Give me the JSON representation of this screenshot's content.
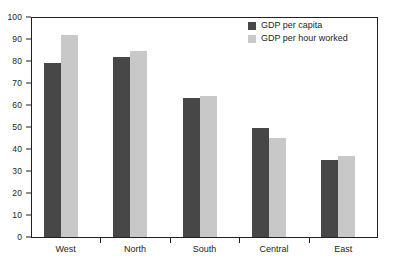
{
  "chart_data": {
    "type": "bar",
    "title": "",
    "subtitle": "",
    "xlabel": "",
    "ylabel": "",
    "categories": [
      "West",
      "North",
      "South",
      "Central",
      "East"
    ],
    "series": [
      {
        "name": "GDP per capita",
        "color": "#474747",
        "values": [
          79,
          82,
          63,
          49.5,
          35
        ]
      },
      {
        "name": "GDP per hour worked",
        "color": "#c8c8c8",
        "values": [
          92,
          84.5,
          64,
          45,
          37
        ]
      }
    ],
    "ylim": [
      0,
      100
    ],
    "ytick_values": [
      0,
      10,
      20,
      30,
      40,
      50,
      60,
      70,
      80,
      90,
      100
    ],
    "ytick_labels": [
      "0",
      "10",
      "20",
      "30",
      "40",
      "50",
      "60",
      "70",
      "80",
      "90",
      "100"
    ],
    "grid": false,
    "legend_position": "top-right",
    "frame_color": "#231f20",
    "background": "#ffffff"
  }
}
